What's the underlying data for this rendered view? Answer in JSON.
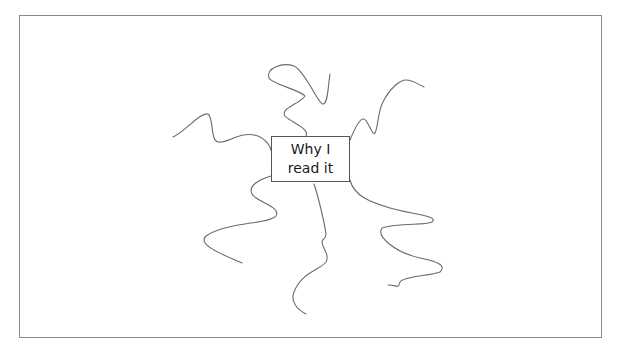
{
  "diagram": {
    "type": "mind-map",
    "center_node": {
      "line1": "Why I",
      "line2": "read it"
    },
    "branches": [
      {
        "name": "branch-upper-left"
      },
      {
        "name": "branch-top"
      },
      {
        "name": "branch-upper-right"
      },
      {
        "name": "branch-lower-left"
      },
      {
        "name": "branch-bottom"
      },
      {
        "name": "branch-lower-right"
      }
    ],
    "colors": {
      "line": "#6a6a6a",
      "box_border": "#555555",
      "frame_border": "#8a8a8a",
      "background": "#ffffff"
    }
  }
}
